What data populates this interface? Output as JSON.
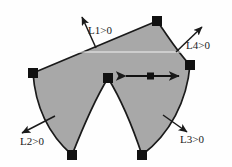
{
  "figure": {
    "background_color": "#fefefe",
    "fill_color": "#a8a8a8",
    "stroke_color": "#1a1a1a",
    "node_color": "#111111",
    "guide_line_color": "#f2f2f2"
  },
  "labels": {
    "L1": "L1>0",
    "L2": "L2>0",
    "L3": "L3>0",
    "L4": "L4>0"
  },
  "annotations": {
    "double_arrow_name": "horizontal-double-arrow",
    "double_arrow_marker": "square-marker",
    "guide_line_name": "faint-horizontal-guide-line"
  },
  "geometry": {
    "vertices": [
      {
        "name": "left-vertex",
        "x": 33,
        "y": 73
      },
      {
        "name": "top-apex-vertex",
        "x": 157,
        "y": 21
      },
      {
        "name": "right-vertex",
        "x": 190,
        "y": 65
      },
      {
        "name": "bottom-right-vertex",
        "x": 142,
        "y": 155
      },
      {
        "name": "central-cusp-vertex",
        "x": 108,
        "y": 78
      },
      {
        "name": "bottom-left-vertex",
        "x": 72,
        "y": 155
      }
    ],
    "normal_arrows": [
      {
        "name": "L1-normal-arrow",
        "x1": 96,
        "y1": 48,
        "x2": 81,
        "y2": 15
      },
      {
        "name": "L4-normal-arrow",
        "x1": 176,
        "y1": 52,
        "x2": 203,
        "y2": 26
      },
      {
        "name": "L2-normal-arrow",
        "x1": 55,
        "y1": 116,
        "x2": 20,
        "y2": 134
      },
      {
        "name": "L3-normal-arrow",
        "x1": 163,
        "y1": 115,
        "x2": 189,
        "y2": 133
      }
    ],
    "double_arrow": {
      "x1": 124,
      "y1": 76,
      "x2": 181,
      "y2": 76,
      "marker_x": 150,
      "marker_y": 76
    },
    "guide_line": {
      "x1": 69,
      "y1": 52,
      "x2": 182,
      "y2": 52
    }
  }
}
